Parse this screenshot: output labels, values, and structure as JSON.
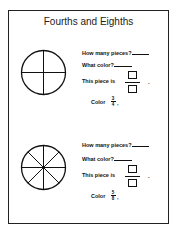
{
  "title": "Fourths and Eighths",
  "sections": [
    {
      "circle": {
        "divisions": 4,
        "icon": "circle-divided-fourths"
      },
      "questions": {
        "how_many": "How many pieces?",
        "what_color": "What color?",
        "this_piece": "This piece is",
        "color_prefix": "Color",
        "color_numerator": "3",
        "color_denominator": "4",
        "color_suffix": ","
      }
    },
    {
      "circle": {
        "divisions": 8,
        "icon": "circle-divided-eighths"
      },
      "questions": {
        "how_many": "How many pieces?",
        "what_color": "What color?",
        "this_piece": "This piece is",
        "color_prefix": "Color",
        "color_numerator": "5",
        "color_denominator": "8",
        "color_suffix": ","
      }
    }
  ],
  "punctuation": {
    "period": "."
  }
}
